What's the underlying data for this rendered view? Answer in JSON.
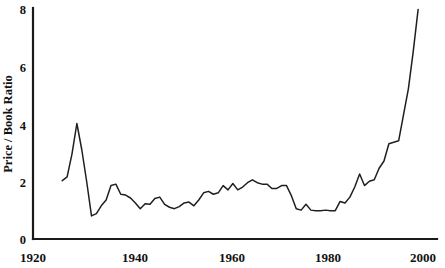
{
  "chart_data": {
    "type": "line",
    "title": "",
    "xlabel": "",
    "ylabel": "Price / Book Ratio",
    "xlim": [
      1920,
      2000
    ],
    "ylim": [
      0,
      8
    ],
    "xticks": [
      1920,
      1940,
      1960,
      1980,
      2000
    ],
    "xtick_labels": [
      "1920",
      "1940",
      "1960",
      "1980",
      "2000"
    ],
    "yticks": [
      0,
      2,
      4,
      6,
      8
    ],
    "ytick_labels": [
      "0",
      "2",
      "4",
      "6",
      "8"
    ],
    "grid": false,
    "legend": false,
    "series": [
      {
        "name": "Price / Book Ratio",
        "color": "#1f1f1f",
        "x": [
          1926,
          1927,
          1928,
          1929,
          1930,
          1931,
          1932,
          1933,
          1934,
          1935,
          1936,
          1937,
          1938,
          1939,
          1940,
          1941,
          1942,
          1943,
          1944,
          1945,
          1946,
          1947,
          1948,
          1949,
          1950,
          1951,
          1952,
          1953,
          1954,
          1955,
          1956,
          1957,
          1958,
          1959,
          1960,
          1961,
          1962,
          1963,
          1964,
          1965,
          1966,
          1967,
          1968,
          1969,
          1970,
          1971,
          1972,
          1973,
          1974,
          1975,
          1976,
          1977,
          1978,
          1979,
          1980,
          1981,
          1982,
          1983,
          1984,
          1985,
          1986,
          1987,
          1988,
          1989,
          1990,
          1991,
          1992,
          1993,
          1994,
          1995,
          1996,
          1997,
          1998,
          1999
        ],
        "values": [
          2.02,
          2.15,
          2.95,
          4.0,
          3.1,
          2.0,
          0.8,
          0.88,
          1.15,
          1.35,
          1.85,
          1.9,
          1.55,
          1.52,
          1.42,
          1.25,
          1.05,
          1.22,
          1.2,
          1.4,
          1.45,
          1.2,
          1.1,
          1.05,
          1.12,
          1.25,
          1.28,
          1.15,
          1.35,
          1.6,
          1.65,
          1.55,
          1.6,
          1.85,
          1.7,
          1.92,
          1.7,
          1.8,
          1.95,
          2.05,
          1.95,
          1.9,
          1.9,
          1.75,
          1.75,
          1.85,
          1.85,
          1.5,
          1.05,
          1.0,
          1.2,
          1.0,
          0.98,
          0.98,
          1.0,
          0.98,
          0.98,
          1.3,
          1.25,
          1.45,
          1.8,
          2.25,
          1.85,
          2.0,
          2.05,
          2.45,
          2.7,
          3.3,
          3.35,
          3.4,
          4.3,
          5.2,
          6.5,
          7.95
        ]
      }
    ]
  },
  "geometry": {
    "plot_left": 33,
    "plot_right": 423,
    "plot_top": 8,
    "plot_bottom": 239
  }
}
